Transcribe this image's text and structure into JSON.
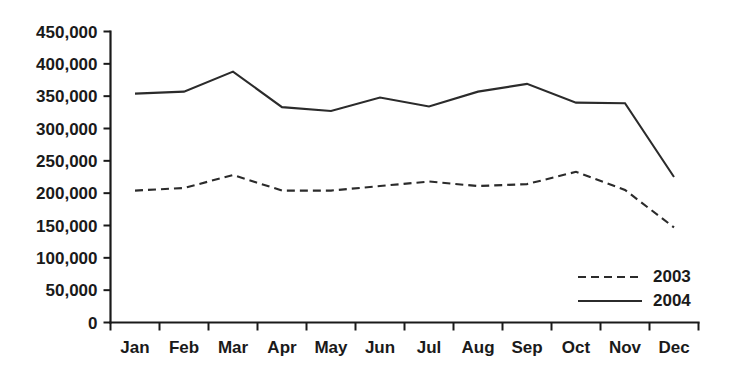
{
  "chart_data": {
    "type": "line",
    "title": "",
    "subtitle": "",
    "xlabel": "",
    "ylabel": "",
    "categories": [
      "Jan",
      "Feb",
      "Mar",
      "Apr",
      "May",
      "Jun",
      "Jul",
      "Aug",
      "Sep",
      "Oct",
      "Nov",
      "Dec"
    ],
    "ylim": [
      0,
      450000
    ],
    "ytick_values": [
      0,
      50000,
      100000,
      150000,
      200000,
      250000,
      300000,
      350000,
      400000,
      450000
    ],
    "ytick_labels": [
      "0",
      "50,000",
      "100,000",
      "150,000",
      "200,000",
      "250,000",
      "300,000",
      "350,000",
      "400,000",
      "450,000"
    ],
    "grid": false,
    "legend_position": "bottom-right",
    "series": [
      {
        "name": "2003",
        "style": "dashed",
        "color": "#2b2b2b",
        "values": [
          204000,
          208000,
          228000,
          204000,
          204000,
          211000,
          218000,
          211000,
          214000,
          233000,
          205000,
          147000
        ]
      },
      {
        "name": "2004",
        "style": "solid",
        "color": "#2b2b2b",
        "values": [
          354000,
          357000,
          388000,
          333000,
          327000,
          348000,
          334000,
          357000,
          369000,
          340000,
          339000,
          225000
        ]
      }
    ]
  },
  "legend": {
    "items": [
      {
        "label": "2003",
        "style": "dashed"
      },
      {
        "label": "2004",
        "style": "solid"
      }
    ]
  }
}
